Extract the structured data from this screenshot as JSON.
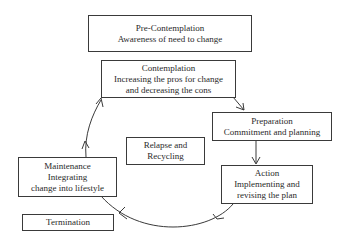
{
  "diagram": {
    "type": "cycle",
    "stages": {
      "precontemplation": {
        "title": "Pre-Contemplation",
        "lines": [
          "Awareness of need to change"
        ]
      },
      "contemplation": {
        "title": "Contemplation",
        "lines": [
          "Increasing the pros for change",
          "and decreasing the cons"
        ]
      },
      "preparation": {
        "title": "Preparation",
        "lines": [
          "Commitment and planning"
        ]
      },
      "action": {
        "title": "Action",
        "lines": [
          "Implementing and",
          "revising the plan"
        ]
      },
      "maintenance": {
        "title": "Maintenance",
        "lines": [
          "Integrating",
          "change into lifestyle"
        ]
      },
      "relapse": {
        "title": "Relapse and",
        "lines": [
          "Recycling"
        ]
      },
      "termination": {
        "title": "Termination",
        "lines": []
      }
    },
    "edges": [
      {
        "from": "contemplation",
        "to": "preparation"
      },
      {
        "from": "preparation",
        "to": "action"
      },
      {
        "from": "action",
        "to": "maintenance"
      },
      {
        "from": "maintenance",
        "to": "contemplation"
      }
    ],
    "colors": {
      "line": "#3a3a3a",
      "text": "#2a2a2a",
      "background": "#ffffff"
    }
  }
}
